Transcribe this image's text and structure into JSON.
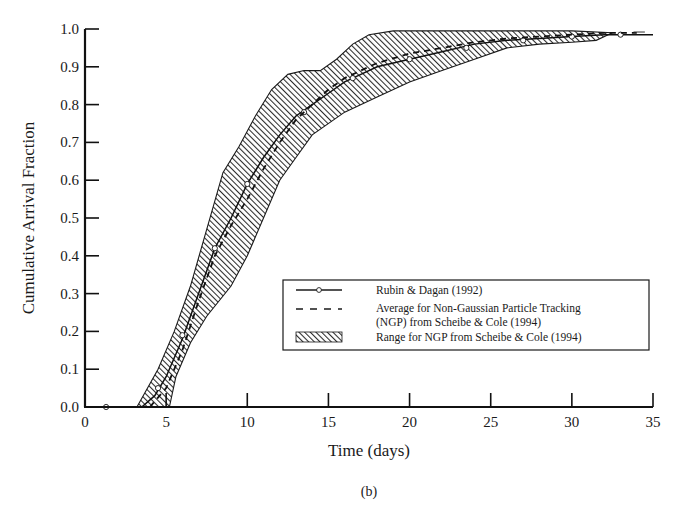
{
  "chart_data": {
    "type": "line",
    "title": "",
    "caption": "(b)",
    "xlabel": "Time (days)",
    "ylabel": "Cumulative Arrival Fraction",
    "xlim": [
      0,
      35
    ],
    "ylim": [
      0.0,
      1.0
    ],
    "x_ticks": [
      0,
      5,
      10,
      15,
      20,
      25,
      30,
      35
    ],
    "x_tick_labels": [
      "0",
      "5",
      "10",
      "15",
      "20",
      "25",
      "30",
      "35"
    ],
    "y_ticks": [
      0.0,
      0.1,
      0.2,
      0.3,
      0.4,
      0.5,
      0.6,
      0.7,
      0.8,
      0.9,
      1.0
    ],
    "y_tick_labels": [
      "0.0",
      "0.1",
      "0.2",
      "0.3",
      "0.4",
      "0.5",
      "0.6",
      "0.7",
      "0.8",
      "0.9",
      "1.0"
    ],
    "grid": false,
    "legend_position": "bottom-right",
    "legend": [
      {
        "label": "Rubin & Dagan (1992)",
        "style": "solid-with-circle"
      },
      {
        "label": "Average for Non-Gaussian Particle Tracking",
        "label2": "(NGP) from Scheibe & Cole (1994)",
        "style": "dashed"
      },
      {
        "label": "Range for NGP from Scheibe & Cole (1994)",
        "style": "hatched"
      }
    ],
    "series": [
      {
        "name": "Rubin & Dagan (1992)",
        "style": "solid",
        "markers": "circle",
        "x": [
          1.3,
          3.5,
          4.3,
          5.0,
          6.0,
          7.0,
          8.0,
          9.0,
          10.0,
          11.0,
          12.0,
          13.0,
          14.0,
          15.0,
          16.0,
          17.0,
          18.0,
          19.0,
          20.0,
          22.0,
          24.0,
          26.0,
          28.0,
          30.0,
          32.0,
          33.0,
          35.0
        ],
        "y": [
          0.0,
          0.0,
          0.03,
          0.08,
          0.18,
          0.3,
          0.42,
          0.5,
          0.59,
          0.66,
          0.72,
          0.77,
          0.8,
          0.83,
          0.86,
          0.88,
          0.9,
          0.91,
          0.92,
          0.94,
          0.96,
          0.97,
          0.975,
          0.98,
          0.985,
          0.985,
          0.985
        ],
        "marker_x": [
          1.3,
          4.5,
          6.0,
          8.0,
          10.0,
          13.5,
          16.5,
          20.0,
          23.5,
          27.0,
          30.0,
          33.0
        ],
        "marker_y": [
          0.0,
          0.05,
          0.19,
          0.42,
          0.59,
          0.78,
          0.87,
          0.92,
          0.95,
          0.97,
          0.98,
          0.985
        ]
      },
      {
        "name": "Average for Non-Gaussian Particle Tracking (NGP) from Scheibe & Cole (1994)",
        "style": "dashed",
        "x": [
          4.0,
          5.0,
          6.0,
          7.0,
          8.0,
          9.0,
          10.0,
          11.0,
          12.0,
          13.0,
          14.0,
          15.0,
          16.0,
          17.0,
          18.0,
          20.0,
          22.0,
          24.0,
          26.0,
          28.0,
          30.0,
          32.0,
          34.0
        ],
        "y": [
          0.0,
          0.05,
          0.15,
          0.28,
          0.4,
          0.48,
          0.55,
          0.63,
          0.7,
          0.76,
          0.8,
          0.84,
          0.87,
          0.89,
          0.91,
          0.935,
          0.95,
          0.965,
          0.975,
          0.98,
          0.985,
          0.99,
          0.99
        ]
      }
    ],
    "range_band": {
      "name": "Range for NGP from Scheibe & Cole (1994)",
      "upper": {
        "x": [
          3.2,
          4.5,
          5.5,
          6.5,
          7.5,
          8.5,
          9.5,
          10.5,
          11.5,
          12.5,
          13.5,
          14.5,
          15.5,
          16.5,
          17.5,
          19.0,
          21.0,
          25.0,
          30.0,
          32.5
        ],
        "y": [
          0.0,
          0.1,
          0.2,
          0.32,
          0.47,
          0.62,
          0.69,
          0.77,
          0.84,
          0.88,
          0.89,
          0.89,
          0.92,
          0.96,
          0.985,
          0.995,
          0.995,
          0.995,
          0.995,
          0.99
        ]
      },
      "lower": {
        "x": [
          5.2,
          5.6,
          6.5,
          7.5,
          9.0,
          10.0,
          11.0,
          12.0,
          13.0,
          14.0,
          16.0,
          18.0,
          20.0,
          22.0,
          24.0,
          26.0,
          28.0,
          30.0,
          31.5,
          32.5
        ],
        "y": [
          0.0,
          0.08,
          0.17,
          0.24,
          0.32,
          0.4,
          0.5,
          0.6,
          0.66,
          0.72,
          0.78,
          0.82,
          0.86,
          0.89,
          0.92,
          0.95,
          0.96,
          0.965,
          0.97,
          0.99
        ]
      }
    }
  }
}
